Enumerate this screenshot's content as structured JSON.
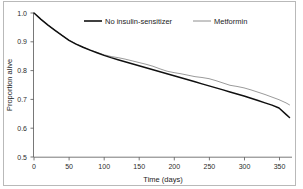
{
  "chart_data": {
    "type": "line",
    "title": "",
    "subtitle": "",
    "xlabel": "Time (days)",
    "ylabel": "Proportion alive",
    "xlim": [
      0,
      365
    ],
    "ylim": [
      0.5,
      1.0
    ],
    "xticks": [
      0,
      50,
      100,
      150,
      200,
      250,
      300,
      350
    ],
    "xticklabels": [
      "0",
      "50",
      "100",
      "150",
      "200",
      "250",
      "300",
      "350"
    ],
    "yticks": [
      0.5,
      0.6,
      0.7,
      0.8,
      0.9,
      1.0
    ],
    "yticklabels": [
      "0.5",
      "0.6",
      "0.7",
      "0.8",
      "0.9",
      "1.0"
    ],
    "grid": false,
    "legend_position": "top-center",
    "series": [
      {
        "name": "No insulin-sensitizer",
        "color": "#101010",
        "linewidth": "thick",
        "x": [
          0,
          10,
          20,
          30,
          40,
          50,
          60,
          70,
          80,
          90,
          100,
          110,
          120,
          130,
          140,
          150,
          160,
          170,
          180,
          190,
          200,
          210,
          220,
          230,
          240,
          250,
          260,
          270,
          280,
          290,
          300,
          310,
          320,
          330,
          340,
          350,
          360,
          365
        ],
        "values": [
          1.0,
          0.978,
          0.958,
          0.94,
          0.922,
          0.905,
          0.892,
          0.881,
          0.871,
          0.862,
          0.853,
          0.845,
          0.838,
          0.831,
          0.824,
          0.817,
          0.81,
          0.803,
          0.796,
          0.789,
          0.782,
          0.775,
          0.768,
          0.761,
          0.754,
          0.747,
          0.74,
          0.733,
          0.726,
          0.719,
          0.712,
          0.704,
          0.696,
          0.688,
          0.68,
          0.67,
          0.648,
          0.637
        ]
      },
      {
        "name": "Metformin",
        "color": "#8e8e8e",
        "linewidth": "thin",
        "x": [
          0,
          10,
          20,
          30,
          40,
          50,
          60,
          70,
          80,
          90,
          100,
          110,
          120,
          130,
          140,
          150,
          160,
          170,
          180,
          190,
          200,
          210,
          220,
          230,
          240,
          250,
          260,
          270,
          280,
          290,
          300,
          310,
          320,
          330,
          340,
          350,
          360,
          365
        ],
        "values": [
          1.0,
          0.978,
          0.958,
          0.94,
          0.922,
          0.906,
          0.893,
          0.882,
          0.872,
          0.863,
          0.855,
          0.849,
          0.845,
          0.84,
          0.834,
          0.828,
          0.822,
          0.815,
          0.806,
          0.798,
          0.793,
          0.789,
          0.784,
          0.779,
          0.776,
          0.772,
          0.765,
          0.757,
          0.749,
          0.745,
          0.74,
          0.733,
          0.725,
          0.717,
          0.708,
          0.699,
          0.688,
          0.681
        ]
      }
    ],
    "legend": [
      {
        "label": "No insulin-sensitizer",
        "color": "#101010"
      },
      {
        "label": "Metformin",
        "color": "#8e8e8e"
      }
    ]
  },
  "axes": {
    "xlabel": "Time (days)",
    "ylabel": "Proportion alive"
  },
  "legend": {
    "entry_0_label": "No insulin-sensitizer",
    "entry_1_label": "Metformin"
  },
  "xticklabels": {
    "t0": "0",
    "t1": "50",
    "t2": "100",
    "t3": "150",
    "t4": "200",
    "t5": "250",
    "t6": "300",
    "t7": "350"
  },
  "yticklabels": {
    "t0": "1.0",
    "t1": "0.9",
    "t2": "0.8",
    "t3": "0.7",
    "t4": "0.6",
    "t5": "0.5"
  }
}
